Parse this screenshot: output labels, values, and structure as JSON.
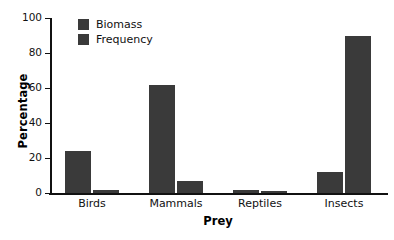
{
  "chart_data": {
    "type": "bar",
    "title": "",
    "xlabel": "Prey",
    "ylabel": "Percentage",
    "categories": [
      "Birds",
      "Mammals",
      "Reptiles",
      "Insects"
    ],
    "series": [
      {
        "name": "Biomass",
        "values": [
          24,
          62,
          2,
          12
        ]
      },
      {
        "name": "Frequency",
        "values": [
          2,
          7,
          1,
          89.5
        ]
      }
    ],
    "ylim": [
      0,
      100
    ],
    "yticks": [
      0,
      20,
      40,
      60,
      80,
      100
    ],
    "ytick_labels": [
      "0",
      "20",
      "40",
      "60",
      "80",
      "100"
    ],
    "grid": false,
    "legend_position": "upper left",
    "bar_color": "#3a3a3a",
    "axis_color": "#111111",
    "background": "#ffffff"
  }
}
